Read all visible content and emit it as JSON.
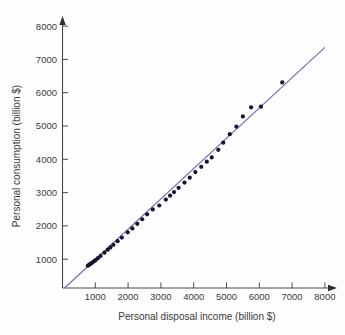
{
  "chart_data": {
    "type": "scatter",
    "title": "",
    "subtitle": "",
    "xlabel": "Personal disposal income (billion $)",
    "ylabel": "Personal consumption (billion $)",
    "xlim": [
      0,
      8400
    ],
    "ylim": [
      0,
      8400
    ],
    "xticks": [
      1000,
      2000,
      3000,
      4000,
      5000,
      6000,
      7000,
      8000
    ],
    "yticks": [
      1000,
      2000,
      3000,
      4000,
      5000,
      6000,
      7000,
      8000
    ],
    "xtick_labels": [
      "1000",
      "2000",
      "3000",
      "4000",
      "5000",
      "6000",
      "7000",
      "8000"
    ],
    "ytick_labels": [
      "1000",
      "2000",
      "3000",
      "4000",
      "5000",
      "6000",
      "7000",
      "8000"
    ],
    "grid": false,
    "legend": false,
    "legend_position": "none",
    "series": [
      {
        "name": "Observations",
        "marker": "filled-circle",
        "color": "#14142b",
        "x": [
          770,
          800,
          830,
          860,
          900,
          940,
          980,
          1020,
          1080,
          1160,
          1280,
          1380,
          1460,
          1550,
          1680,
          1810,
          1990,
          2130,
          2280,
          2430,
          2580,
          2750,
          2950,
          3150,
          3280,
          3400,
          3540,
          3720,
          3880,
          4050,
          4230,
          4400,
          4550,
          4750,
          4900,
          5100,
          5300,
          5500,
          5750,
          6050,
          6700
        ],
        "y": [
          680,
          700,
          720,
          745,
          770,
          800,
          830,
          860,
          910,
          980,
          1080,
          1170,
          1240,
          1320,
          1430,
          1540,
          1700,
          1820,
          1960,
          2100,
          2250,
          2400,
          2520,
          2700,
          2820,
          2930,
          3060,
          3220,
          3370,
          3540,
          3700,
          3860,
          3990,
          4220,
          4440,
          4700,
          4930,
          5240,
          5520,
          5540,
          6280
        ]
      }
    ],
    "trend_line": {
      "name": "Fitted regression line",
      "color": "#6e72b8",
      "x_start": 60,
      "y_start": 0,
      "x_end": 8000,
      "y_end": 7350
    }
  },
  "axes": {
    "x_axis_name": "x-axis",
    "y_axis_name": "y-axis",
    "arrow_x_name": "x-axis-arrow",
    "arrow_y_name": "y-axis-arrow"
  }
}
